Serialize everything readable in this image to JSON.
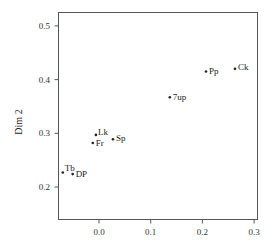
{
  "chart_data": {
    "type": "scatter",
    "title": "",
    "xlabel": "",
    "ylabel": "Dim 2",
    "xlim": [
      -0.075,
      0.31
    ],
    "ylim": [
      0.137,
      0.527
    ],
    "xticks": [
      0.0,
      0.1,
      0.2,
      0.3
    ],
    "xtick_labels": [
      "0.0",
      "0.1",
      "0.2",
      "0.3"
    ],
    "yticks": [
      0.2,
      0.3,
      0.4,
      0.5
    ],
    "ytick_labels": [
      "0.2",
      "0.3",
      "0.4",
      "0.5"
    ],
    "grid": false,
    "legend": null,
    "points": [
      {
        "label": "Tb",
        "x": -0.07,
        "y": 0.227
      },
      {
        "label": "DP",
        "x": -0.051,
        "y": 0.224
      },
      {
        "label": "Lk",
        "x": -0.006,
        "y": 0.297
      },
      {
        "label": "Fr",
        "x": -0.012,
        "y": 0.282
      },
      {
        "label": "Sp",
        "x": 0.027,
        "y": 0.289
      },
      {
        "label": "7up",
        "x": 0.137,
        "y": 0.367
      },
      {
        "label": "Pp",
        "x": 0.207,
        "y": 0.415
      },
      {
        "label": "Ck",
        "x": 0.263,
        "y": 0.42
      }
    ]
  },
  "colors": {
    "axis": "#555555",
    "point": "#222222",
    "text": "#222222"
  }
}
